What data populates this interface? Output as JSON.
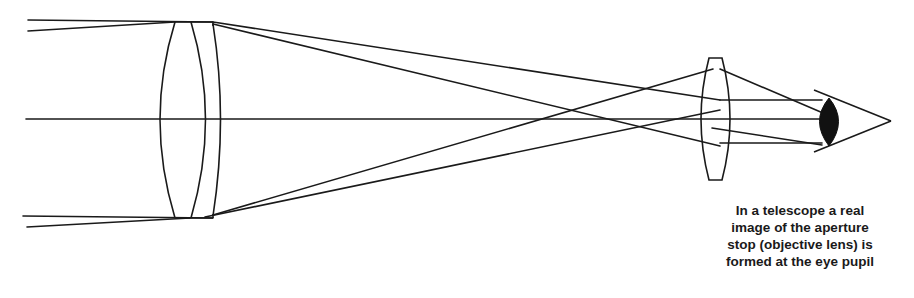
{
  "diagram": {
    "type": "optics-ray-diagram",
    "components": [
      {
        "name": "objective lens (aperture stop)",
        "type": "achromatic doublet"
      },
      {
        "name": "eyepiece lens",
        "type": "biconvex lens"
      },
      {
        "name": "eye",
        "type": "eye with pupil"
      }
    ],
    "optical_axis": "horizontal center line",
    "ray_bundles": [
      "parallel on-axis bundle",
      "parallel off-axis bundle"
    ]
  },
  "caption": {
    "lines": [
      "In a telescope a real",
      "image of the aperture",
      "stop (objective lens) is",
      "formed at the eye pupil"
    ]
  },
  "colors": {
    "line": "#1a1a1a",
    "background": "#ffffff"
  }
}
